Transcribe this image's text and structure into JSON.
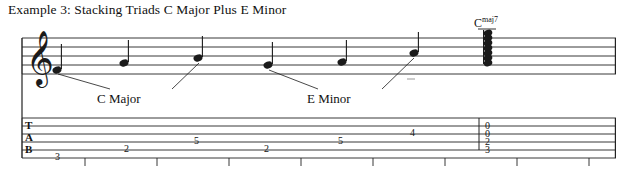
{
  "document": {
    "title": "Example 3: Stacking Triads C Major Plus E Minor",
    "chord_label": {
      "root": "C",
      "quality": "maj7"
    },
    "annotations": [
      {
        "label": "C Major",
        "x": 100,
        "y": 92
      },
      {
        "label": "E Minor",
        "x": 310,
        "y": 92
      }
    ],
    "staff": {
      "clef": "treble-clef",
      "line_count": 5,
      "notes": [
        {
          "index": 0,
          "x": 57,
          "y": 70,
          "stem": "up",
          "beam_group": 1
        },
        {
          "index": 1,
          "x": 124,
          "y": 63,
          "stem": "up",
          "beam_group": 1
        },
        {
          "index": 2,
          "x": 198,
          "y": 58,
          "stem": "up",
          "beam_group": 1
        },
        {
          "index": 3,
          "x": 268,
          "y": 65,
          "stem": "up",
          "beam_group": 2
        },
        {
          "index": 4,
          "x": 342,
          "y": 62,
          "stem": "up",
          "beam_group": 2
        },
        {
          "index": 5,
          "x": 414,
          "y": 53,
          "stem": "up",
          "beam_group": 2
        },
        {
          "index": 6,
          "x": 487,
          "y": 50,
          "stem": "chord",
          "beam_group": 0
        }
      ]
    },
    "tab": {
      "line_count": 6,
      "letters": [
        "T",
        "A",
        "B"
      ],
      "entries": [
        {
          "string": 6,
          "fret": "3",
          "x": 57
        },
        {
          "string": 5,
          "fret": "2",
          "x": 126
        },
        {
          "string": 4,
          "fret": "5",
          "x": 196
        },
        {
          "string": 5,
          "fret": "2",
          "x": 266
        },
        {
          "string": 4,
          "fret": "5",
          "x": 340
        },
        {
          "string": 3,
          "fret": "4",
          "x": 412
        },
        {
          "string": 1,
          "fret": "0",
          "x": 487
        },
        {
          "string": 2,
          "fret": "0",
          "x": 487
        },
        {
          "string": 3,
          "fret": "2",
          "x": 487
        },
        {
          "string": 4,
          "fret": "3",
          "x": 487
        }
      ]
    },
    "colors": {
      "ink": "#1a1a1a",
      "paper": "#ffffff",
      "staff_line": "#222222"
    }
  }
}
